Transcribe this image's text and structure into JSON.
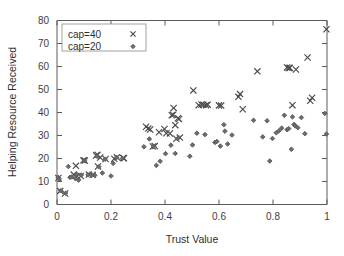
{
  "chart_data": {
    "type": "scatter",
    "title": "",
    "xlabel": "Trust Value",
    "ylabel": "Helping Resource Received",
    "xlim": [
      0,
      1
    ],
    "ylim": [
      0,
      80
    ],
    "xticks": [
      "0",
      "0.2",
      "0.4",
      "0.6",
      "0.8",
      "1"
    ],
    "xtick_values": [
      0,
      0.2,
      0.4,
      0.6,
      0.8,
      1
    ],
    "yticks": [
      "0",
      "10",
      "20",
      "30",
      "40",
      "50",
      "60",
      "70",
      "80"
    ],
    "ytick_values": [
      0,
      10,
      20,
      30,
      40,
      50,
      60,
      70,
      80
    ],
    "grid": false,
    "legend_position": "top-left-inside",
    "series": [
      {
        "name": "cap=40",
        "marker": "cross",
        "color": "#4a4a4a",
        "points": [
          [
            0.005,
            11.5
          ],
          [
            0.012,
            5.9
          ],
          [
            0.03,
            4.8
          ],
          [
            0.062,
            13.0
          ],
          [
            0.07,
            16.8
          ],
          [
            0.075,
            12.3
          ],
          [
            0.088,
            12.4
          ],
          [
            0.098,
            19.2
          ],
          [
            0.103,
            19.1
          ],
          [
            0.118,
            13.0
          ],
          [
            0.132,
            12.9
          ],
          [
            0.145,
            21.3
          ],
          [
            0.15,
            21.6
          ],
          [
            0.152,
            16.5
          ],
          [
            0.16,
            20.4
          ],
          [
            0.18,
            19.8
          ],
          [
            0.212,
            19.9
          ],
          [
            0.222,
            20.5
          ],
          [
            0.245,
            20.2
          ],
          [
            0.248,
            20.1
          ],
          [
            0.33,
            33.8
          ],
          [
            0.338,
            33.0
          ],
          [
            0.345,
            32.6
          ],
          [
            0.355,
            25.2
          ],
          [
            0.362,
            25.4
          ],
          [
            0.378,
            31.4
          ],
          [
            0.398,
            32.8
          ],
          [
            0.405,
            31.0
          ],
          [
            0.418,
            30.9
          ],
          [
            0.425,
            38.8
          ],
          [
            0.43,
            39.0
          ],
          [
            0.432,
            42.0
          ],
          [
            0.438,
            34.5
          ],
          [
            0.442,
            28.6
          ],
          [
            0.448,
            37.5
          ],
          [
            0.452,
            37.2
          ],
          [
            0.455,
            29.1
          ],
          [
            0.505,
            49.6
          ],
          [
            0.525,
            43.2
          ],
          [
            0.535,
            43.5
          ],
          [
            0.542,
            43.4
          ],
          [
            0.552,
            43.2
          ],
          [
            0.558,
            43.4
          ],
          [
            0.6,
            43.1
          ],
          [
            0.608,
            43.0
          ],
          [
            0.672,
            46.8
          ],
          [
            0.678,
            48.0
          ],
          [
            0.688,
            41.4
          ],
          [
            0.742,
            57.9
          ],
          [
            0.852,
            59.6
          ],
          [
            0.858,
            59.3
          ],
          [
            0.862,
            59.4
          ],
          [
            0.872,
            43.2
          ],
          [
            0.885,
            58.7
          ],
          [
            0.928,
            63.9
          ],
          [
            0.938,
            45.1
          ],
          [
            0.945,
            46.4
          ],
          [
            0.998,
            76.2
          ]
        ]
      },
      {
        "name": "cap=20",
        "marker": "diamond",
        "color": "#6b6b6b",
        "points": [
          [
            0.004,
            11.8
          ],
          [
            0.008,
            11.2
          ],
          [
            0.014,
            6.0
          ],
          [
            0.032,
            4.9
          ],
          [
            0.042,
            16.5
          ],
          [
            0.048,
            11.8
          ],
          [
            0.055,
            12.0
          ],
          [
            0.068,
            11.3
          ],
          [
            0.072,
            13.2
          ],
          [
            0.08,
            10.6
          ],
          [
            0.09,
            12.8
          ],
          [
            0.102,
            19.0
          ],
          [
            0.115,
            12.9
          ],
          [
            0.128,
            12.8
          ],
          [
            0.14,
            12.7
          ],
          [
            0.148,
            21.0
          ],
          [
            0.155,
            16.4
          ],
          [
            0.168,
            13.7
          ],
          [
            0.178,
            19.7
          ],
          [
            0.2,
            12.4
          ],
          [
            0.208,
            17.9
          ],
          [
            0.22,
            20.4
          ],
          [
            0.242,
            20.0
          ],
          [
            0.322,
            25.1
          ],
          [
            0.342,
            28.5
          ],
          [
            0.358,
            25.3
          ],
          [
            0.368,
            17.0
          ],
          [
            0.382,
            18.8
          ],
          [
            0.402,
            22.1
          ],
          [
            0.422,
            25.8
          ],
          [
            0.438,
            22.2
          ],
          [
            0.448,
            28.8
          ],
          [
            0.492,
            21.0
          ],
          [
            0.502,
            25.9
          ],
          [
            0.518,
            31.0
          ],
          [
            0.548,
            30.4
          ],
          [
            0.585,
            27.0
          ],
          [
            0.592,
            27.4
          ],
          [
            0.605,
            25.4
          ],
          [
            0.618,
            34.7
          ],
          [
            0.622,
            31.9
          ],
          [
            0.632,
            26.3
          ],
          [
            0.648,
            30.2
          ],
          [
            0.728,
            36.6
          ],
          [
            0.762,
            29.4
          ],
          [
            0.778,
            36.4
          ],
          [
            0.788,
            18.9
          ],
          [
            0.798,
            28.7
          ],
          [
            0.812,
            31.2
          ],
          [
            0.822,
            32.0
          ],
          [
            0.832,
            33.2
          ],
          [
            0.842,
            38.8
          ],
          [
            0.852,
            32.5
          ],
          [
            0.858,
            33.0
          ],
          [
            0.868,
            24.0
          ],
          [
            0.872,
            38.1
          ],
          [
            0.878,
            34.8
          ],
          [
            0.882,
            34.2
          ],
          [
            0.892,
            33.4
          ],
          [
            0.905,
            37.8
          ],
          [
            0.918,
            30.8
          ],
          [
            0.992,
            39.6
          ],
          [
            0.998,
            30.6
          ]
        ]
      }
    ]
  },
  "legend": {
    "entries": [
      {
        "label": "cap=40"
      },
      {
        "label": "cap=20"
      }
    ]
  }
}
